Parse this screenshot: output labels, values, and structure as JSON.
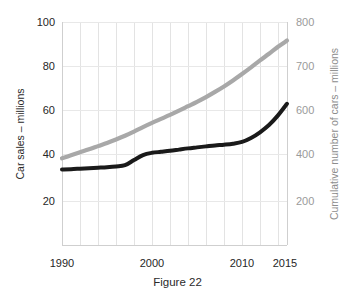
{
  "caption": "Figure 22",
  "chart_data": {
    "type": "line",
    "title": "",
    "xlabel": "",
    "ylabel": "Car sales – millions",
    "y2label": "Cumulative number of cars – millions",
    "grid": true,
    "legend": "none",
    "xlim": [
      1990,
      2015
    ],
    "ylim": [
      10,
      100
    ],
    "y2lim": [
      100,
      800
    ],
    "xticks": [
      1990,
      2000,
      2010,
      2015
    ],
    "xtick_labels": [
      "1990",
      "2000",
      "2010",
      "2015"
    ],
    "yticks": [
      100,
      80,
      60,
      40,
      20
    ],
    "ytick_labels": [
      "100",
      "80",
      "60",
      "40",
      "20"
    ],
    "y2ticks": [
      800,
      700,
      600,
      400,
      200
    ],
    "y2tick_labels": [
      "800",
      "700",
      "600",
      "400",
      "200"
    ],
    "gridline_years": [
      1990,
      1992,
      1994,
      1996,
      1998,
      2000,
      2002,
      2004,
      2006,
      2008,
      2010,
      2012,
      2014
    ],
    "x": [
      1990,
      1991,
      1992,
      1993,
      1994,
      1995,
      1996,
      1997,
      1998,
      1999,
      2000,
      2001,
      2002,
      2003,
      2004,
      2005,
      2006,
      2007,
      2008,
      2009,
      2010,
      2011,
      2012,
      2013,
      2014,
      2015
    ],
    "series": [
      {
        "name": "Car sales – millions",
        "color": "#1a1a1a",
        "axis": "left",
        "values": [
          40.5,
          40.6,
          40.8,
          41.0,
          41.2,
          41.4,
          41.7,
          42.2,
          44.3,
          46.3,
          47.2,
          47.6,
          48.0,
          48.5,
          49.0,
          49.4,
          49.8,
          50.2,
          50.5,
          50.9,
          51.6,
          53.2,
          55.5,
          58.4,
          62.3,
          67.0
        ]
      },
      {
        "name": "Cumulative number of cars – millions",
        "color": "#a8a8a8",
        "axis": "right",
        "values": [
          45.0,
          46.2,
          47.4,
          48.6,
          49.9,
          51.2,
          52.6,
          54.1,
          55.8,
          57.6,
          59.3,
          60.9,
          62.5,
          64.2,
          66.0,
          67.8,
          69.7,
          71.8,
          74.0,
          76.4,
          79.0,
          81.7,
          84.5,
          87.2,
          90.0,
          92.5
        ]
      }
    ]
  }
}
